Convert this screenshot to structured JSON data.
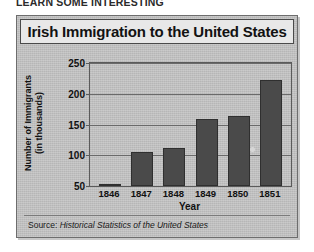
{
  "top_caption": "LEARN SOME INTERESTING",
  "figure": {
    "title": "Irish Immigration to the United States",
    "source_prefix": "Source:",
    "source_italic": "Historical Statistics of the United States"
  },
  "chart_data": {
    "type": "bar",
    "title": "Irish Immigration to the United States",
    "xlabel": "Year",
    "ylabel": "Number of Immigrants (in thousands)",
    "ylabel_line1": "Number of Immigrants",
    "ylabel_line2": "(in thousands)",
    "categories": [
      "1846",
      "1847",
      "1848",
      "1849",
      "1850",
      "1851"
    ],
    "values": [
      51,
      105,
      112,
      159,
      164,
      222
    ],
    "ylim": [
      50,
      250
    ],
    "yticks": [
      50,
      100,
      150,
      200,
      250
    ],
    "ytick_labels": [
      "50",
      "100",
      "150",
      "200",
      "250"
    ],
    "grid": true,
    "legend": false,
    "bar_color": "#4a4a4a",
    "plot_background": "#c3c3c3"
  },
  "colors": {
    "frame_border": "#6d6d6d",
    "title_background": "#e8e8e8",
    "title_text": "#121212",
    "bar": "#4a4a4a",
    "gridline": "#6a6a6a"
  }
}
